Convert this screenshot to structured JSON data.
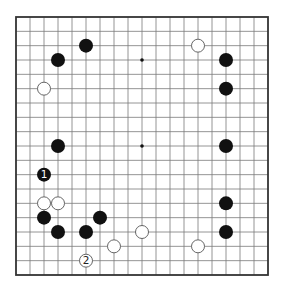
{
  "diagram": {
    "type": "go-board",
    "size": 19,
    "frame": {
      "left": 16,
      "top": 17,
      "right": 268,
      "bottom": 275
    },
    "colors": {
      "line": "#7a7a7a",
      "frame": "#333333",
      "black": "#111111",
      "white": "#ffffff",
      "white_stroke": "#555555",
      "star": "#111111"
    },
    "star_points": [
      [
        9,
        3
      ],
      [
        9,
        9
      ]
    ],
    "stones": [
      {
        "color": "black",
        "col": 5,
        "row": 2,
        "label": ""
      },
      {
        "color": "black",
        "col": 3,
        "row": 3,
        "label": ""
      },
      {
        "color": "white",
        "col": 2,
        "row": 5,
        "label": ""
      },
      {
        "color": "white",
        "col": 13,
        "row": 2,
        "label": ""
      },
      {
        "color": "black",
        "col": 15,
        "row": 3,
        "label": ""
      },
      {
        "color": "black",
        "col": 15,
        "row": 5,
        "label": ""
      },
      {
        "color": "black",
        "col": 3,
        "row": 9,
        "label": ""
      },
      {
        "color": "black",
        "col": 15,
        "row": 9,
        "label": ""
      },
      {
        "color": "black",
        "col": 2,
        "row": 11,
        "label": "1"
      },
      {
        "color": "white",
        "col": 2,
        "row": 13,
        "label": ""
      },
      {
        "color": "white",
        "col": 3,
        "row": 13,
        "label": ""
      },
      {
        "color": "black",
        "col": 2,
        "row": 14,
        "label": ""
      },
      {
        "color": "black",
        "col": 6,
        "row": 14,
        "label": ""
      },
      {
        "color": "black",
        "col": 3,
        "row": 15,
        "label": ""
      },
      {
        "color": "black",
        "col": 5,
        "row": 15,
        "label": ""
      },
      {
        "color": "white",
        "col": 9,
        "row": 15,
        "label": ""
      },
      {
        "color": "white",
        "col": 7,
        "row": 16,
        "label": ""
      },
      {
        "color": "white",
        "col": 5,
        "row": 17,
        "label": "2"
      },
      {
        "color": "black",
        "col": 15,
        "row": 13,
        "label": ""
      },
      {
        "color": "black",
        "col": 15,
        "row": 15,
        "label": ""
      },
      {
        "color": "white",
        "col": 13,
        "row": 16,
        "label": ""
      }
    ]
  }
}
